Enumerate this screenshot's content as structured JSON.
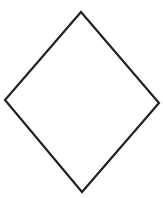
{
  "canvas": {
    "width": 163,
    "height": 198,
    "background": "#ffffff"
  },
  "shape": {
    "type": "diamond",
    "points": "81,12 159,103 82,192 5,100",
    "stroke": "#222222",
    "stroke_width": 2.2,
    "fill": "#ffffff"
  }
}
